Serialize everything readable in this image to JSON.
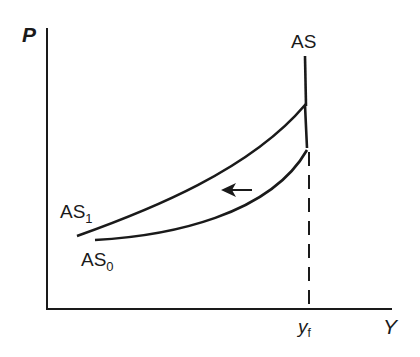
{
  "diagram": {
    "y_axis_label": "P",
    "x_axis_label": "Y",
    "x_tick_label": "y",
    "x_tick_subscript": "f",
    "curves": {
      "vertical_label": "AS",
      "upper_label": "AS",
      "upper_subscript": "1",
      "lower_label": "AS",
      "lower_subscript": "0"
    },
    "arrow_direction": "left",
    "colors": {
      "line": "#1a1a1a",
      "background": "#ffffff"
    }
  }
}
